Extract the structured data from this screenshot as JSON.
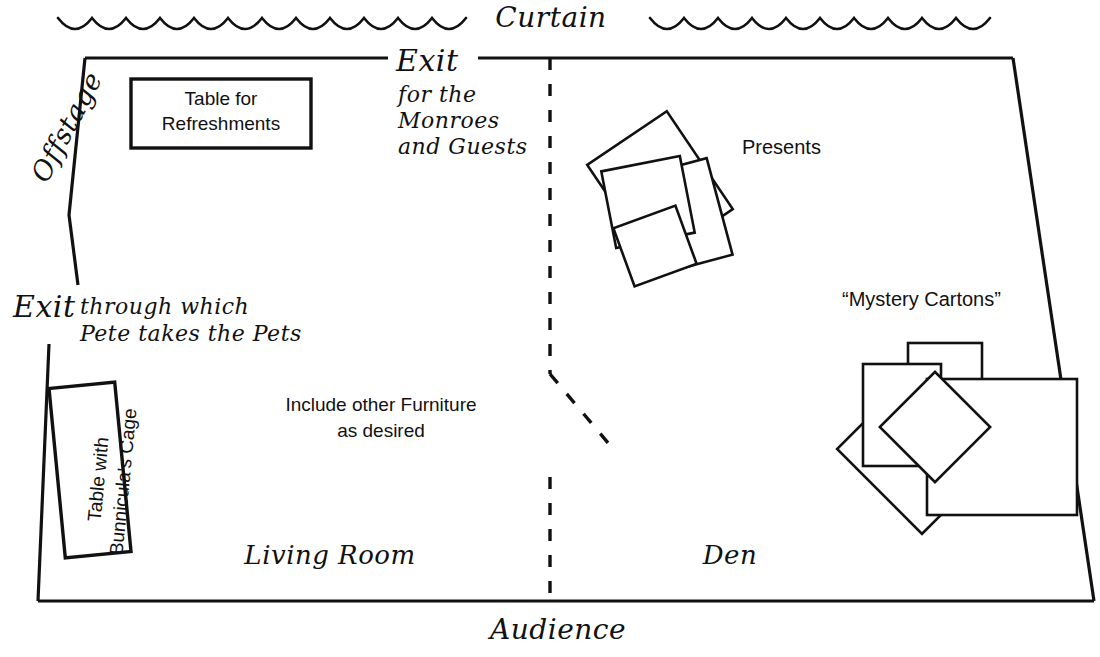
{
  "diagram": {
    "labels": {
      "curtain": "Curtain",
      "audience": "Audience",
      "offstage": "Offstage",
      "exit_monroes_word": "Exit",
      "exit_monroes_detail": "for the\nMonroes\nand Guests",
      "exit_pets_word": "Exit",
      "exit_pets_detail": "through which\nPete takes the Pets",
      "table_refreshments": "Table for\nRefreshments",
      "table_bunnicula": "Table with\nBunnicula's Cage",
      "include_furniture": "Include other Furniture\nas desired",
      "living_room": "Living Room",
      "den": "Den",
      "presents": "Presents",
      "mystery_cartons": "“Mystery Cartons”"
    },
    "colors": {
      "ink": "#111111",
      "paper": "#ffffff"
    },
    "props": {
      "presents_count": 4,
      "cartons_count": 4
    }
  }
}
